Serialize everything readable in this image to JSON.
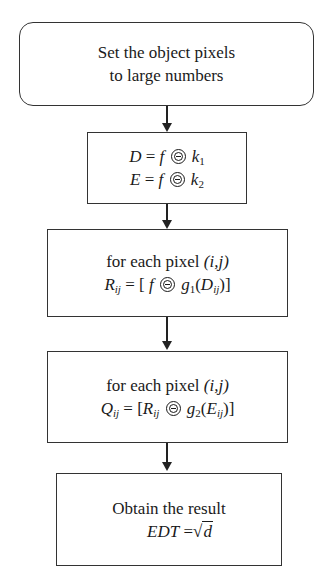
{
  "diagram": {
    "type": "flowchart",
    "nodes": [
      {
        "id": "init",
        "shape": "rounded-rectangle",
        "lines": [
          "Set the object pixels",
          "to large numbers"
        ]
      },
      {
        "id": "erode",
        "shape": "rectangle",
        "lines": [
          "D = f ⊖ k1",
          "E = f ⊖ k2"
        ],
        "parts": {
          "line1": {
            "lhs": "D",
            "eq": "=",
            "f": "f",
            "sub_base": "k",
            "sub": "1"
          },
          "line2": {
            "lhs": "E",
            "eq": "=",
            "f": "f",
            "sub_base": "k",
            "sub": "2"
          }
        }
      },
      {
        "id": "compute_r",
        "shape": "rectangle",
        "lines": [
          "for each pixel (i,j)",
          "Rij = [f ⊖ g1(Dij)]"
        ],
        "parts": {
          "text": "for each pixel ",
          "ij": "(i,j)",
          "lhs": "R",
          "lhs_sub": "ij",
          "open": "= [",
          "f": "f",
          "g": "g",
          "g_sub": "1",
          "arg": "D",
          "arg_sub": "ij",
          "close": ")]"
        }
      },
      {
        "id": "compute_q",
        "shape": "rectangle",
        "lines": [
          "for each pixel (i,j)",
          "Qij = [Rij ⊖ g2(Eij)]"
        ],
        "parts": {
          "text": "for each pixel ",
          "ij": "(i,j)",
          "lhs": "Q",
          "lhs_sub": "ij",
          "open": "= [",
          "r": "R",
          "r_sub": "ij",
          "g": "g",
          "g_sub": "2",
          "arg": "E",
          "arg_sub": "ij",
          "close": ")]"
        }
      },
      {
        "id": "result",
        "shape": "rectangle",
        "lines": [
          "Obtain the result",
          "EDT = √d"
        ],
        "parts": {
          "text": "Obtain the result",
          "lhs": "EDT",
          "eq": " =",
          "sqrt": "√",
          "radicand": "d"
        }
      }
    ],
    "edges": [
      {
        "from": "init",
        "to": "erode"
      },
      {
        "from": "erode",
        "to": "compute_r"
      },
      {
        "from": "compute_r",
        "to": "compute_q"
      },
      {
        "from": "compute_q",
        "to": "result"
      }
    ],
    "colors": {
      "stroke": "#333333",
      "text": "#1a1a1a",
      "background": "#ffffff"
    }
  }
}
